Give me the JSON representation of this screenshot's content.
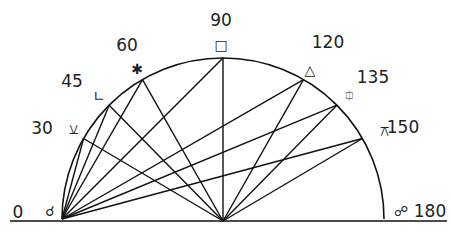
{
  "diagram": {
    "type": "astrological-aspects-semicircle",
    "center": {
      "x": 223,
      "y": 219
    },
    "radius": 161,
    "baseline": {
      "x1": 10,
      "x2": 447,
      "y": 221
    },
    "line_color": "#111111",
    "text_color": "#222222",
    "aspects": [
      {
        "angle": 0,
        "label": "0",
        "symbol": "☌",
        "symbol_name": "conjunction",
        "num_pos": [
          18,
          218
        ],
        "sym_pos": [
          50,
          216
        ]
      },
      {
        "angle": 30,
        "label": "30",
        "symbol": "⚺",
        "symbol_name": "semi-sextile",
        "num_pos": [
          42,
          134
        ],
        "sym_pos": [
          73,
          134
        ]
      },
      {
        "angle": 45,
        "label": "45",
        "symbol": "∟",
        "symbol_name": "semi-square",
        "num_pos": [
          72,
          87
        ],
        "sym_pos": [
          99,
          101
        ]
      },
      {
        "angle": 60,
        "label": "60",
        "symbol": "✱",
        "symbol_name": "sextile",
        "num_pos": [
          127,
          51
        ],
        "sym_pos": [
          137,
          74
        ]
      },
      {
        "angle": 90,
        "label": "90",
        "symbol": "□",
        "symbol_name": "square",
        "num_pos": [
          221,
          26
        ],
        "sym_pos": [
          221,
          50
        ]
      },
      {
        "angle": 120,
        "label": "120",
        "symbol": "△",
        "symbol_name": "trine",
        "num_pos": [
          328,
          48
        ],
        "sym_pos": [
          310,
          75
        ]
      },
      {
        "angle": 135,
        "label": "135",
        "symbol": "⯐",
        "symbol_name": "sesquiquadrate",
        "num_pos": [
          373,
          83
        ],
        "sym_pos": [
          349,
          100
        ]
      },
      {
        "angle": 150,
        "label": "150",
        "symbol": "⚻",
        "symbol_name": "quincunx",
        "num_pos": [
          403,
          133
        ],
        "sym_pos": [
          384,
          136
        ]
      },
      {
        "angle": 180,
        "label": "180",
        "symbol": "☍",
        "symbol_name": "opposition",
        "num_pos": [
          430,
          217
        ],
        "sym_pos": [
          401,
          216
        ]
      }
    ]
  }
}
